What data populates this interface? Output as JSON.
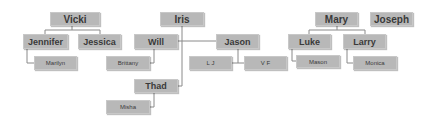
{
  "diagram": {
    "type": "family-tree",
    "colors": {
      "node_fill": "#b8b8b8",
      "node_text": "#3a3a3a",
      "connector": "#8a8a8a",
      "background": "#ffffff"
    },
    "nodes": {
      "vicki": "Vicki",
      "jennifer": "Jennifer",
      "jessica": "Jessica",
      "marilyn": "Marilyn",
      "iris": "Iris",
      "will": "Will",
      "brittany": "Brittany",
      "jason": "Jason",
      "lj": "L J",
      "vf": "V F",
      "thad": "Thad",
      "misha": "Misha",
      "mary": "Mary",
      "joseph": "Joseph",
      "luke": "Luke",
      "larry": "Larry",
      "mason": "Mason",
      "monica": "Monica"
    },
    "edges": [
      [
        "Vicki",
        "Jennifer"
      ],
      [
        "Vicki",
        "Jessica"
      ],
      [
        "Jennifer",
        "Marilyn"
      ],
      [
        "Iris",
        "Will"
      ],
      [
        "Iris",
        "Jason"
      ],
      [
        "Iris",
        "Thad"
      ],
      [
        "Will",
        "Brittany"
      ],
      [
        "Jason",
        "L J"
      ],
      [
        "Jason",
        "V F"
      ],
      [
        "Thad",
        "Misha"
      ],
      [
        "Mary",
        "Luke"
      ],
      [
        "Mary",
        "Larry"
      ],
      [
        "Luke",
        "Mason"
      ],
      [
        "Larry",
        "Monica"
      ]
    ]
  }
}
